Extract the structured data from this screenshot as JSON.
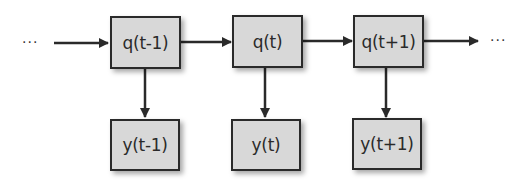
{
  "diagram": {
    "ellipsis_left": "···",
    "ellipsis_right": "···",
    "states": [
      {
        "label": "q(t-1)"
      },
      {
        "label": "q(t)"
      },
      {
        "label": "q(t+1)"
      }
    ],
    "outputs": [
      {
        "label": "y(t-1)"
      },
      {
        "label": "y(t)"
      },
      {
        "label": "y(t+1)"
      }
    ],
    "colors": {
      "box_fill": "#d8d8d8",
      "stroke": "#2a2a2a"
    }
  }
}
